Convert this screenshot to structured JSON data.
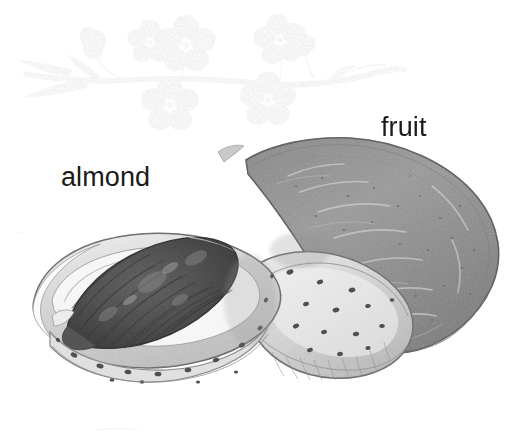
{
  "figure": {
    "kind": "botanical-pencil-illustration",
    "subject": "almond",
    "background_color": "#ffffff",
    "width": 520,
    "height": 441
  },
  "labels": {
    "almond": "almond",
    "fruit": "fruit"
  },
  "colors": {
    "background": "#ffffff",
    "label_text": "#1a1a1a",
    "graphite_dark": "#4a4a4a",
    "graphite_mid": "#8d8d8d",
    "graphite_light": "#c4c4c4",
    "graphite_pale": "#e4e4e4",
    "kernel_dark": "#575757",
    "kernel_darkest": "#3e3e3e",
    "hull_gray": "#a3a3a3",
    "hull_gray_dark": "#8a8a8a",
    "shell_pale": "#dcdcdc",
    "pit_dot": "#4f4f4f",
    "branch_brown": "#6e6e6e"
  },
  "parts": {
    "branch": "flowering-almond-branch",
    "blossoms_count": 6,
    "leaves_count": 3,
    "kernel": "almond-seed-kernel",
    "shell_half_left": "pitted-shell-half-open",
    "shell_half_lower": "pitted-shell-half-lower",
    "hull": "green-fruit-hull"
  }
}
